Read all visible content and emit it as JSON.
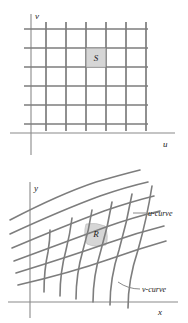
{
  "figure": {
    "colors": {
      "grid_line": "#7d7d7d",
      "axis_line": "#8a8a8a",
      "shaded_cell": "#d6d6d6",
      "shaded_cell_border": "#9a9a9a",
      "text": "#1a1a1a",
      "background": "#ffffff"
    }
  },
  "panel_uv": {
    "name": "uv-plane",
    "axis_v_label": "v",
    "axis_u_label": "u",
    "region_label": "S",
    "grid": {
      "type": "rectangular",
      "vertical_lines": 6,
      "horizontal_lines": 6,
      "spacing_px": 19
    }
  },
  "panel_xy": {
    "name": "xy-plane",
    "axis_y_label": "y",
    "axis_x_label": "x",
    "region_label": "R",
    "u_curve_label": "u-curve",
    "v_curve_label": "v-curve",
    "grid": {
      "type": "curvilinear",
      "u_curves": 6,
      "v_curves": 6
    }
  }
}
